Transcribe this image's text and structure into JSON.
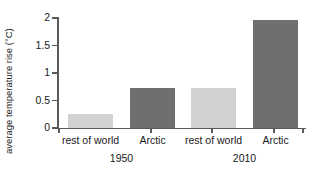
{
  "chart_data": {
    "type": "bar",
    "title": "",
    "xlabel": "",
    "ylabel": "average temperature rise (°C)",
    "ylim": [
      0,
      2
    ],
    "grid": false,
    "legend": "none",
    "categories": [
      "rest of world",
      "Arctic",
      "rest of world",
      "Arctic"
    ],
    "groups": [
      "1950",
      "2010"
    ],
    "values": [
      0.25,
      0.72,
      0.72,
      1.96
    ],
    "y_ticks": [
      "0",
      "0.5",
      "1",
      "1.5",
      "2"
    ],
    "y_tick_values": [
      0,
      0.5,
      1,
      1.5,
      2
    ],
    "bar_colors": [
      "#d2d2d2",
      "#6f6f6f",
      "#d2d2d2",
      "#6f6f6f"
    ],
    "axis_color": "#5a5a5a"
  },
  "axis": {
    "y_title": "average temperature rise (°C)",
    "ticks": [
      {
        "label": "2",
        "value": 2
      },
      {
        "label": "1.5",
        "value": 1.5
      },
      {
        "label": "1",
        "value": 1
      },
      {
        "label": "0.5",
        "value": 0.5
      },
      {
        "label": "0",
        "value": 0
      }
    ]
  },
  "bars": [
    {
      "label": "rest of world",
      "group": "1950",
      "value": 0.25,
      "color": "#d2d2d2"
    },
    {
      "label": "Arctic",
      "group": "1950",
      "value": 0.72,
      "color": "#6f6f6f"
    },
    {
      "label": "rest of world",
      "group": "2010",
      "value": 0.72,
      "color": "#d2d2d2"
    },
    {
      "label": "Arctic",
      "group": "2010",
      "value": 1.96,
      "color": "#6f6f6f"
    }
  ],
  "groups": [
    {
      "label": "1950"
    },
    {
      "label": "2010"
    }
  ]
}
